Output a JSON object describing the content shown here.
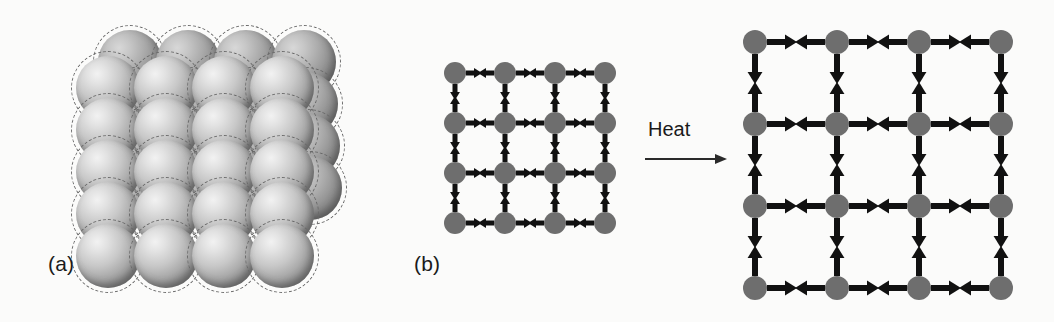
{
  "figure": {
    "background_color": "#fbfbfa",
    "panels": [
      {
        "id": "a",
        "label": "(a)",
        "label_x": 48,
        "label_y": 252,
        "description": "close-packed solid: spheres in a cubic stack, each ringed by a dashed circle showing thermal vibration amplitude",
        "sphere_color_light": "#f2f2f2",
        "sphere_color_dark": "#5e5e5e",
        "halo_color": "#6a6a6a"
      },
      {
        "id": "b",
        "label": "(b)",
        "label_x": 14,
        "label_y": 252,
        "description": "spring-lattice model: 4x4 array of atoms joined by paired opposing arrows, shown cold then heated"
      }
    ],
    "transition": {
      "label": "Heat",
      "label_x": 248,
      "label_y": 118,
      "arrow_x": 245,
      "arrow_y": 152,
      "arrow_length": 82,
      "color": "#2a2a2a"
    },
    "node_color": "#6e6e6e",
    "arrow_color": "#111111"
  },
  "chart_data": {
    "type": "diagram",
    "lattices": [
      {
        "name": "cold-lattice",
        "state": "before heating",
        "rows": 4,
        "cols": 4,
        "origin_x": 55,
        "origin_y": 73,
        "spacing": 50,
        "node_radius": 11,
        "arrow_half_length": 16,
        "arrow_head": 8,
        "arrow_thickness": 5
      },
      {
        "name": "hot-lattice",
        "state": "after heating",
        "rows": 4,
        "cols": 4,
        "origin_x": 355,
        "origin_y": 42,
        "spacing": 82,
        "node_radius": 12,
        "arrow_half_length": 30,
        "arrow_head": 12,
        "arrow_thickness": 6
      }
    ],
    "spheres": {
      "name": "sphere-pack",
      "radius": 32,
      "halo_radius": 37,
      "row_count": 5,
      "col_count": 4,
      "back_row_count": 4,
      "origin_x": 108,
      "origin_y": 88,
      "dx": 58,
      "dy": 42,
      "offset_x": 22,
      "offset_y": -26
    }
  }
}
